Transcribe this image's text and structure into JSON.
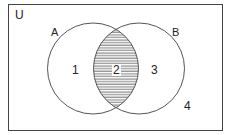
{
  "diagram": {
    "type": "venn",
    "universe_label": "U",
    "sets": [
      {
        "label": "A"
      },
      {
        "label": "B"
      }
    ],
    "regions": [
      {
        "label": "1",
        "description": "A only"
      },
      {
        "label": "2",
        "description": "A and B (shaded)"
      },
      {
        "label": "3",
        "description": "B only"
      },
      {
        "label": "4",
        "description": "outside A and B"
      }
    ],
    "shaded_region": "2",
    "colors": {
      "stroke": "#555555",
      "hatch": "#666666",
      "background": "#ffffff"
    }
  }
}
